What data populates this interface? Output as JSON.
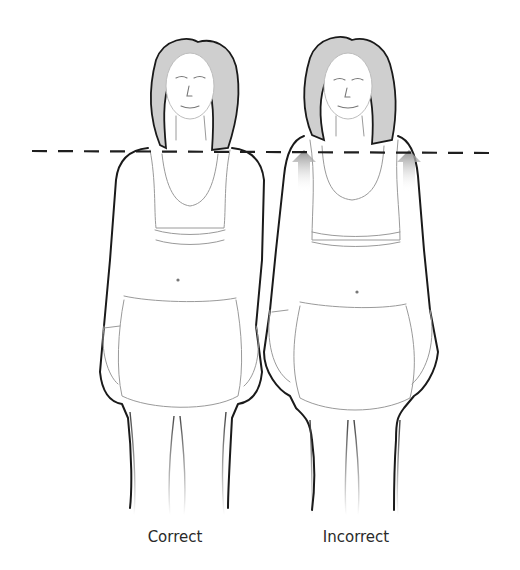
{
  "figure": {
    "type": "posture-comparison-illustration",
    "guide_line": {
      "style": "dashed",
      "meaning": "shoulder-level reference",
      "color": "#1f1f1f"
    },
    "panels": [
      {
        "id": "correct",
        "label": "Correct",
        "shoulders": "level, relaxed",
        "arrows": 0
      },
      {
        "id": "incorrect",
        "label": "Incorrect",
        "shoulders": "raised toward ears",
        "arrows": 2,
        "arrow_direction": "up",
        "arrow_color": "#8f8f8f"
      }
    ]
  },
  "labels": {
    "correct": "Correct",
    "incorrect": "Incorrect"
  },
  "colors": {
    "background": "#ffffff",
    "outline": "#1a1a1a",
    "hair_shade": "#cfcfcf",
    "arrow_shade": "#8f8f8f",
    "caption_text": "#2a2a2a"
  }
}
